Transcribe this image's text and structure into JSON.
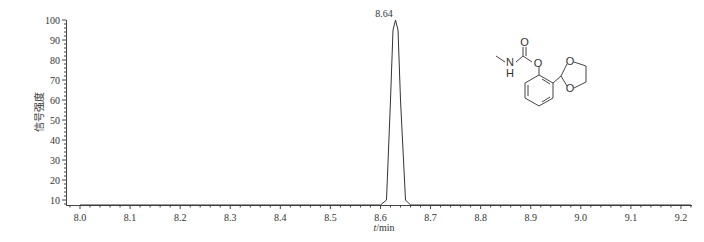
{
  "chart_data": {
    "type": "line",
    "title": "",
    "xlabel": "t/min",
    "ylabel": "信号强度",
    "xlim": [
      7.98,
      9.23
    ],
    "ylim": [
      7,
      100
    ],
    "x_ticks": [
      "8.0",
      "8.1",
      "8.2",
      "8.3",
      "8.4",
      "8.5",
      "8.6",
      "8.7",
      "8.8",
      "8.9",
      "9.0",
      "9.1",
      "9.2"
    ],
    "y_ticks": [
      "10",
      "20",
      "30",
      "40",
      "50",
      "60",
      "70",
      "80",
      "90",
      "100"
    ],
    "grid": false,
    "legend": null,
    "series": [
      {
        "name": "chromatogram",
        "x": [
          8.0,
          8.6,
          8.612,
          8.62,
          8.625,
          8.63,
          8.635,
          8.64,
          8.65,
          8.66,
          9.22
        ],
        "values": [
          7,
          7,
          10,
          60,
          95,
          100,
          95,
          60,
          10,
          7,
          7
        ]
      }
    ],
    "annotations": [
      {
        "text": "8.64",
        "x": 8.625,
        "y": 100,
        "type": "peak-label"
      }
    ],
    "inset": {
      "type": "chemical-structure",
      "atoms": [
        "O",
        "N",
        "H",
        "O",
        "O",
        "O"
      ]
    }
  },
  "labels": {
    "peak": "8.64",
    "x_axis_italic": "t",
    "x_axis_unit": "/min",
    "y_axis": "信号强度"
  },
  "structure": {
    "carbonyl_o": "O",
    "nh_n": "N",
    "nh_h": "H",
    "ester_o": "O",
    "ring_o1": "O",
    "ring_o2": "O"
  }
}
